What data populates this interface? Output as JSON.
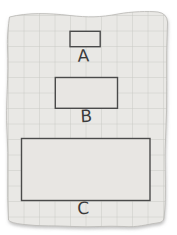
{
  "figure": {
    "type": "math-diagram",
    "paper": {
      "fill": "#e9e8e5",
      "grid_line_color": "#c8c7c4",
      "grid_cell_px": 15.5,
      "edge_color": "#bdbcb9",
      "background": "#ffffff"
    },
    "rectangles": [
      {
        "label": "A",
        "width_units": 2,
        "height_units": 1,
        "fill": "#e8e6e3",
        "border": "#4a4a4a"
      },
      {
        "label": "B",
        "width_units": 4,
        "height_units": 2,
        "fill": "#e8e6e3",
        "border": "#4a4a4a"
      },
      {
        "label": "C",
        "width_units": 8,
        "height_units": 4,
        "fill": "#e8e6e3",
        "border": "#4a4a4a"
      }
    ],
    "label_color": "#3b3b3b"
  }
}
